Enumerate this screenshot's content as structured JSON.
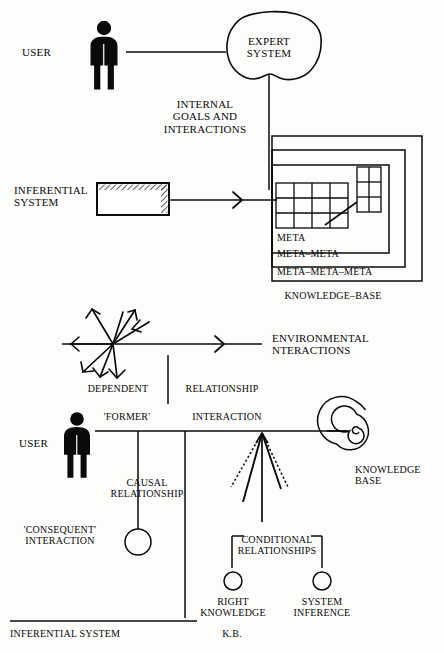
{
  "diagram": {
    "background_color": "#fdfdfc",
    "ink_color": "#0a0a0a",
    "width": 444,
    "height": 653
  },
  "upper_section": {
    "user_label": "USER",
    "expert_system_label": "EXPERT\nSYSTEM",
    "internal_goals_label": "INTERNAL\nGOALS AND\nINTERACTIONS",
    "inferential_system_label": "INFERENTIAL\nSYSTEM",
    "knowledge_base_label": "KNOWLEDGE–BASE",
    "meta_levels": [
      "META",
      "META–META",
      "META–META–META"
    ],
    "grid": {
      "columns": 4,
      "rows": 3,
      "side_columns": 2,
      "side_rows": 3
    }
  },
  "lower_section": {
    "environmental_label": "ENVIRONMENTAL\nNTERACTIONS",
    "dependent_label": "DEPENDENT",
    "relationship_label": "RELATIONSHIP",
    "former_label": "'FORMER'",
    "interaction_label": "INTERACTION",
    "user_label": "USER",
    "causal_label": "CAUSAL\nRELATIONSHIP",
    "consequent_label": "'CONSEQUENT'\nINTERACTION",
    "knowledge_base_label": "KNOWLEDGE\nBASE",
    "conditional_label": "CONDITIONAL\nRELATIONSHIPS",
    "right_knowledge_label": "RIGHT\nKNOWLEDGE",
    "system_inference_label": "SYSTEM\nINFERENCE",
    "inferential_system_label": "INFERENTIAL SYSTEM",
    "kb_label": "K.B."
  },
  "icons": {
    "user_figure": "person-pictogram",
    "expert_system": "cloud-blob-shape",
    "inferential_box": "hatched-rectangle",
    "knowledge_spiral": "spiral-shape",
    "starburst": "multi-arrow-starburst",
    "node_circle": "open-circle"
  }
}
